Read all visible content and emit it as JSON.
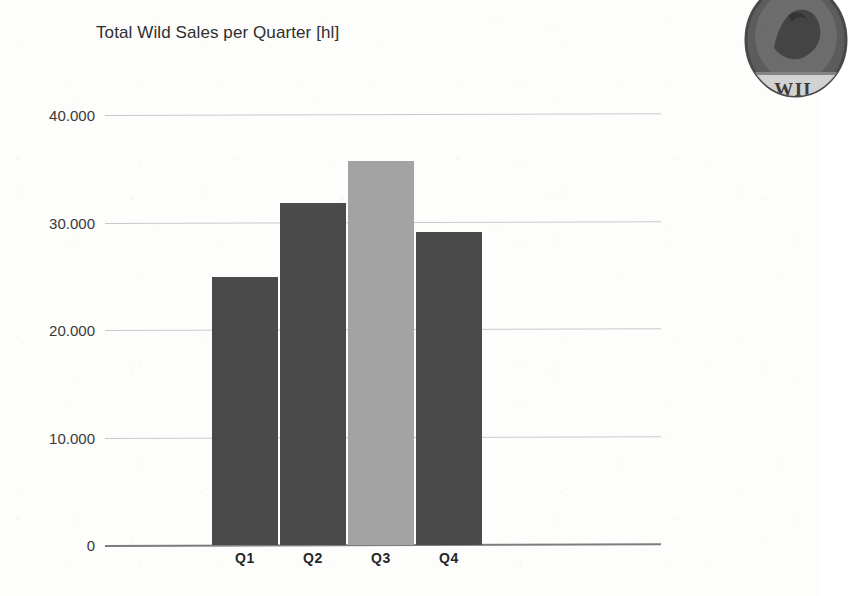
{
  "chart_data": {
    "type": "bar",
    "title": "Total Wild Sales per Quarter [hl]",
    "xlabel": "",
    "ylabel": "",
    "unit": "hl",
    "categories": [
      "Q1",
      "Q2",
      "Q3",
      "Q4"
    ],
    "values": [
      24950,
      31800,
      35700,
      29100
    ],
    "ylim": [
      0,
      40000
    ],
    "yticks": [
      0,
      10000,
      20000,
      30000,
      40000
    ],
    "ytick_labels": [
      "0",
      "10.000",
      "20.000",
      "30.000",
      "40.000"
    ],
    "grid": true,
    "legend": false,
    "bar_colors": [
      "#4a4a4a",
      "#4a4a4a",
      "#a3a3a3",
      "#4a4a4a"
    ],
    "highlighted_category": "Q3"
  },
  "colors": {
    "bar_dark": "#4a4a4a",
    "bar_light": "#a3a3a3",
    "gridline": "#c9c9c9",
    "axis": "#7d7d7d",
    "title_text": "#2f2f2f",
    "tick_text": "#3a3a3a",
    "xtick_text": "#262626",
    "background": "#fdfdfc"
  },
  "logo": {
    "icon": "wild-brand-badge-icon",
    "wordmark": "WIL"
  }
}
